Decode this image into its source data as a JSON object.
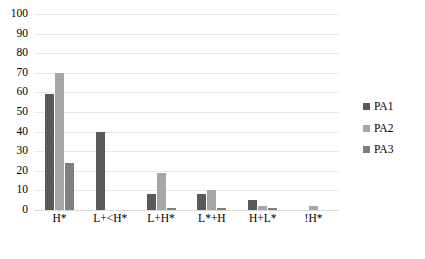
{
  "chart_data": {
    "type": "bar",
    "title": "",
    "xlabel": "",
    "ylabel": "",
    "ylim": [
      0,
      100
    ],
    "yticks": [
      0,
      10,
      20,
      30,
      40,
      50,
      60,
      70,
      80,
      90,
      100
    ],
    "grid": true,
    "legend_position": "right",
    "categories": [
      "H*",
      "L+<H*",
      "L+H*",
      "L*+H",
      "H+L*",
      "!H*"
    ],
    "series": [
      {
        "name": "PA1",
        "color": "#595959",
        "values": [
          59,
          40,
          8,
          8,
          5,
          0
        ]
      },
      {
        "name": "PA2",
        "color": "#a6a6a6",
        "values": [
          70,
          0,
          19,
          10,
          2,
          2
        ]
      },
      {
        "name": "PA3",
        "color": "#7f7f7f",
        "values": [
          24,
          0,
          1,
          1,
          1,
          0
        ]
      }
    ]
  },
  "axis": {
    "y_tick_labels": [
      "100",
      "90",
      "80",
      "70",
      "60",
      "50",
      "40",
      "30",
      "20",
      "10",
      "0"
    ]
  },
  "legend": {
    "items": [
      {
        "label": "PA1"
      },
      {
        "label": "PA2"
      },
      {
        "label": "PA3"
      }
    ]
  },
  "caption": {
    "text": ""
  }
}
